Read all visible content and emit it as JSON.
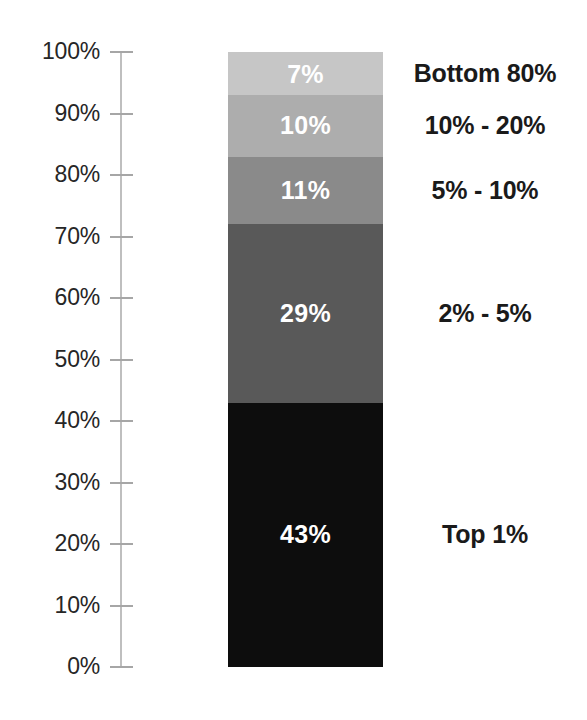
{
  "chart_data": {
    "type": "bar",
    "title": "",
    "subtitle": "",
    "xlabel": "",
    "ylabel": "",
    "orientation": "vertical-stacked",
    "stacked": true,
    "grid": false,
    "legend": "right-of-bar",
    "ylim": [
      0,
      100
    ],
    "y_axis": {
      "min": 0,
      "max": 100,
      "step": 10,
      "unit": "%",
      "tick_labels": [
        "100%",
        "90%",
        "80%",
        "70%",
        "60%",
        "50%",
        "40%",
        "30%",
        "20%",
        "10%",
        "0%"
      ],
      "tick_values": [
        100,
        90,
        80,
        70,
        60,
        50,
        40,
        30,
        20,
        10,
        0
      ],
      "axis_color": "#bfbfbf",
      "tick_color": "#a6a6a6",
      "label_color": "#262626"
    },
    "categories": [
      "Bottom 80%",
      "10% - 20%",
      "5% - 10%",
      "2% - 5%",
      "Top 1%"
    ],
    "values": [
      7,
      10,
      11,
      29,
      43
    ],
    "value_labels": [
      "7%",
      "10%",
      "11%",
      "29%",
      "43%"
    ],
    "colors": [
      "#c6c6c6",
      "#adadad",
      "#8a8a8a",
      "#595959",
      "#0d0d0d"
    ],
    "value_label_color": "#ffffff",
    "category_label_color": "#1a1a1a",
    "segments": [
      {
        "value_label": "7%",
        "value": 7,
        "category": "Bottom 80%",
        "color": "#c6c6c6"
      },
      {
        "value_label": "10%",
        "value": 10,
        "category": "10% - 20%",
        "color": "#adadad"
      },
      {
        "value_label": "11%",
        "value": 11,
        "category": "5% - 10%",
        "color": "#8a8a8a"
      },
      {
        "value_label": "29%",
        "value": 29,
        "category": "2% - 5%",
        "color": "#595959"
      },
      {
        "value_label": "43%",
        "value": 43,
        "category": "Top 1%",
        "color": "#0d0d0d"
      }
    ]
  }
}
